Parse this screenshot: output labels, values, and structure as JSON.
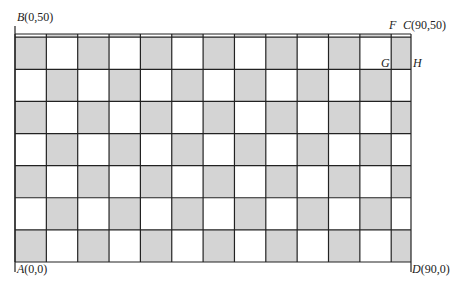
{
  "diagram": {
    "type": "checkerboard-grid",
    "full_columns": 12,
    "partial_columns": 1,
    "full_rows": 7,
    "partial_top_strip": true,
    "colors": {
      "shaded": "#d4d4d4",
      "unshaded": "#ffffff",
      "line": "#222222"
    },
    "points": [
      {
        "id": "B",
        "name": "B",
        "coords": "(0,50)",
        "position": "top-left"
      },
      {
        "id": "A",
        "name": "A",
        "coords": "(0,0)",
        "position": "bottom-left"
      },
      {
        "id": "C",
        "name": "C",
        "coords": "(90,50)",
        "position": "top-right"
      },
      {
        "id": "D",
        "name": "D",
        "coords": "(90,0)",
        "position": "bottom-right"
      },
      {
        "id": "F",
        "name": "F",
        "coords": "",
        "position": "top-right"
      },
      {
        "id": "G",
        "name": "G",
        "coords": "",
        "position": "right"
      },
      {
        "id": "H",
        "name": "H",
        "coords": "",
        "position": "right"
      }
    ]
  }
}
